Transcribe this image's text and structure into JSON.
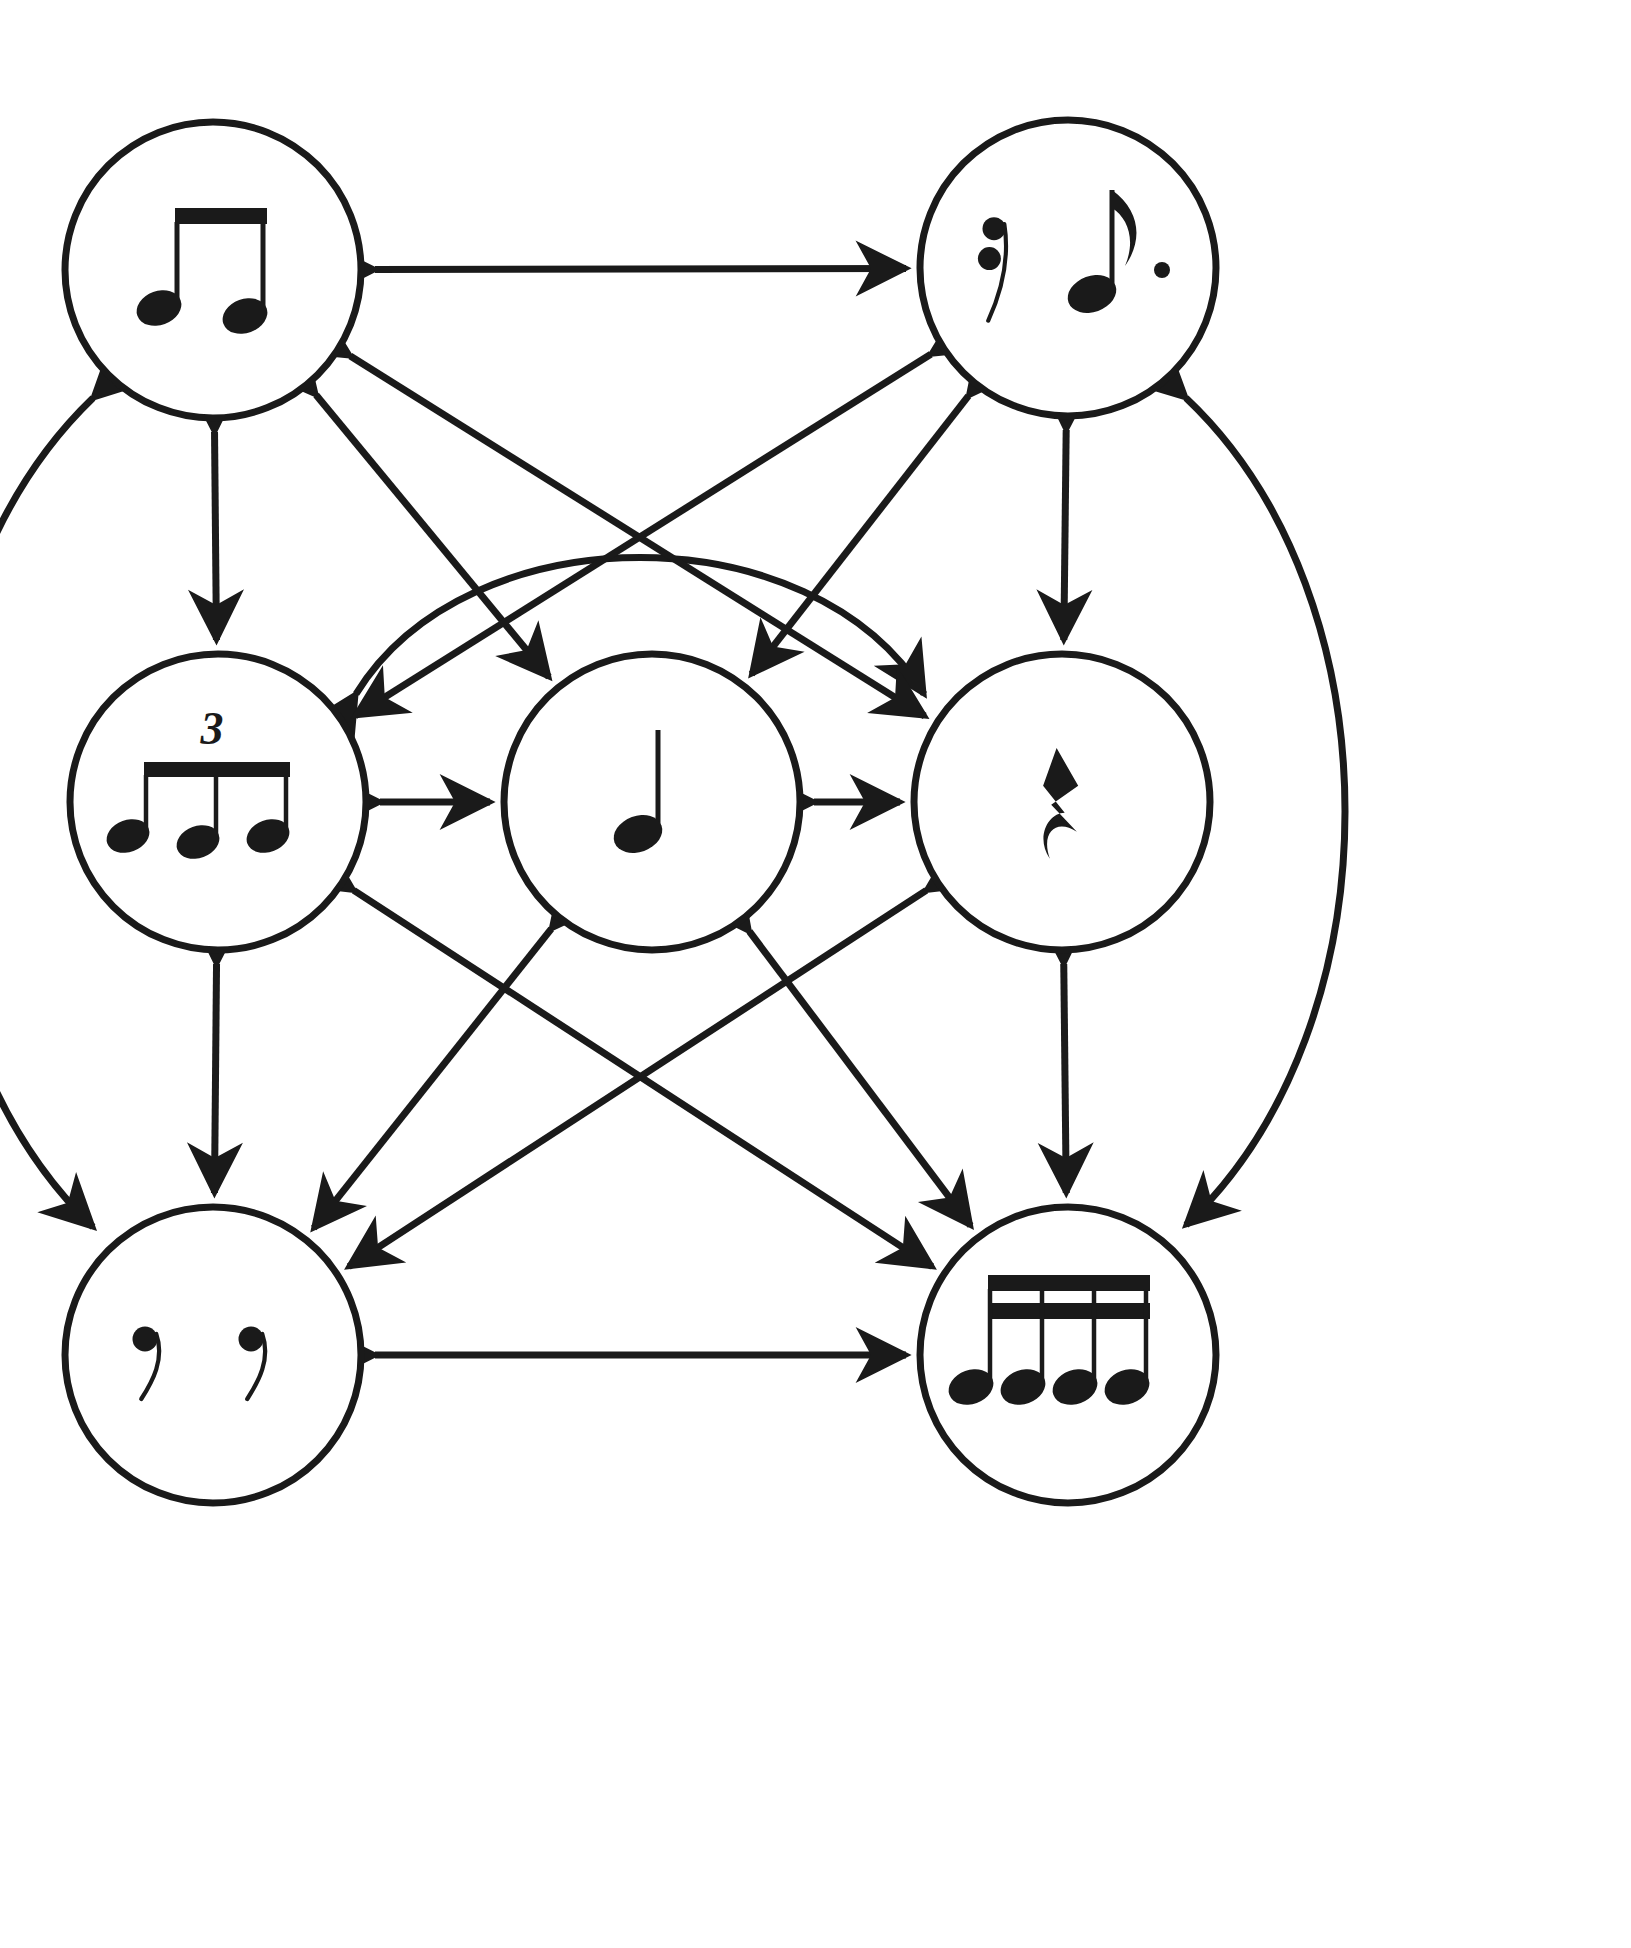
{
  "diagram": {
    "type": "rhythm-equivalence-network",
    "background_color": "#ffffff",
    "stroke_color": "#1a1a1a",
    "node_radius": 148,
    "node_stroke_width": 7,
    "edge_stroke_width": 7,
    "arrowhead": "double-headed",
    "nodes": [
      {
        "id": "top-left",
        "name": "two-eighth-notes",
        "label": "two beamed eighth notes",
        "cx": 213,
        "cy": 270,
        "notation": "beamed-eighth-pair",
        "tuplet": null
      },
      {
        "id": "top-right",
        "name": "sixteenth-rest-dotted-eighth",
        "label": "sixteenth rest and dotted eighth note",
        "cx": 1068,
        "cy": 268,
        "notation": "rest16-dotted-eighth",
        "tuplet": null
      },
      {
        "id": "mid-left",
        "name": "eighth-note-triplet",
        "label": "eighth note triplet",
        "cx": 218,
        "cy": 802,
        "notation": "beamed-triplet",
        "tuplet": "3"
      },
      {
        "id": "mid-center",
        "name": "quarter-note",
        "label": "quarter note",
        "cx": 652,
        "cy": 802,
        "notation": "quarter-note",
        "tuplet": null
      },
      {
        "id": "mid-right",
        "name": "quarter-rest",
        "label": "quarter rest",
        "cx": 1062,
        "cy": 802,
        "notation": "quarter-rest",
        "tuplet": null
      },
      {
        "id": "bottom-left",
        "name": "two-eighth-rests",
        "label": "two eighth rests",
        "cx": 213,
        "cy": 1355,
        "notation": "two-eighth-rests",
        "tuplet": null
      },
      {
        "id": "bottom-right",
        "name": "four-sixteenth-notes",
        "label": "four beamed sixteenth notes",
        "cx": 1068,
        "cy": 1355,
        "notation": "beamed-sixteenth-quad",
        "tuplet": null
      }
    ],
    "edges": [
      {
        "name": "edge-topleft-topright",
        "from": "top-left",
        "to": "top-right",
        "shape": "straight"
      },
      {
        "name": "edge-bottomleft-bottomright",
        "from": "bottom-left",
        "to": "bottom-right",
        "shape": "straight"
      },
      {
        "name": "edge-topleft-midleft",
        "from": "top-left",
        "to": "mid-left",
        "shape": "straight"
      },
      {
        "name": "edge-midleft-bottomleft",
        "from": "mid-left",
        "to": "bottom-left",
        "shape": "straight"
      },
      {
        "name": "edge-topright-midright",
        "from": "top-right",
        "to": "mid-right",
        "shape": "straight"
      },
      {
        "name": "edge-midright-bottomright",
        "from": "mid-right",
        "to": "bottom-right",
        "shape": "straight"
      },
      {
        "name": "edge-midleft-midcenter",
        "from": "mid-left",
        "to": "mid-center",
        "shape": "straight"
      },
      {
        "name": "edge-midcenter-midright",
        "from": "mid-center",
        "to": "mid-right",
        "shape": "straight"
      },
      {
        "name": "edge-topleft-bottomleft-arc",
        "from": "top-left",
        "to": "bottom-left",
        "shape": "arc-left"
      },
      {
        "name": "edge-topright-bottomright-arc",
        "from": "top-right",
        "to": "bottom-right",
        "shape": "arc-right"
      },
      {
        "name": "edge-midleft-midright-arc",
        "from": "mid-left",
        "to": "mid-right",
        "shape": "arc-over-center"
      },
      {
        "name": "edge-topleft-midcenter",
        "from": "top-left",
        "to": "mid-center",
        "shape": "diagonal"
      },
      {
        "name": "edge-topright-midcenter",
        "from": "top-right",
        "to": "mid-center",
        "shape": "diagonal"
      },
      {
        "name": "edge-topleft-midright",
        "from": "top-left",
        "to": "mid-right",
        "shape": "diagonal"
      },
      {
        "name": "edge-topright-midleft",
        "from": "top-right",
        "to": "mid-left",
        "shape": "diagonal"
      },
      {
        "name": "edge-midleft-bottomright",
        "from": "mid-left",
        "to": "bottom-right",
        "shape": "diagonal"
      },
      {
        "name": "edge-midright-bottomleft",
        "from": "mid-right",
        "to": "bottom-left",
        "shape": "diagonal"
      },
      {
        "name": "edge-midcenter-bottomleft",
        "from": "mid-center",
        "to": "bottom-left",
        "shape": "diagonal"
      },
      {
        "name": "edge-midcenter-bottomright",
        "from": "mid-center",
        "to": "bottom-right",
        "shape": "diagonal"
      }
    ]
  }
}
